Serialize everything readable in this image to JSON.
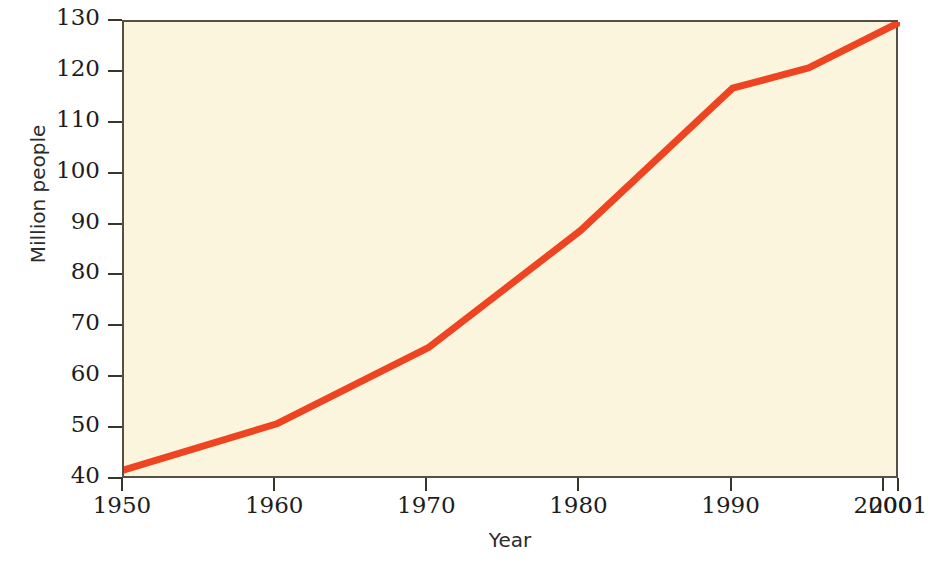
{
  "chart_data": {
    "type": "line",
    "title": "",
    "xlabel": "Year",
    "ylabel": "Million people",
    "xlim": [
      1950,
      2001
    ],
    "ylim": [
      40,
      130
    ],
    "grid": false,
    "legend": null,
    "series": [
      {
        "name": "Population",
        "color": "#ee4422",
        "x": [
          1950,
          1960,
          1970,
          1980,
          1990,
          1995,
          2001
        ],
        "values": [
          42,
          51,
          66,
          89,
          117,
          121,
          130
        ]
      }
    ],
    "x_ticks": [
      {
        "value": 1950,
        "label": "1950"
      },
      {
        "value": 1960,
        "label": "1960"
      },
      {
        "value": 1970,
        "label": "1970"
      },
      {
        "value": 1980,
        "label": "1980"
      },
      {
        "value": 1990,
        "label": "1990"
      },
      {
        "value": 2000,
        "label": "2000"
      },
      {
        "value": 2001,
        "label": "2001"
      }
    ],
    "y_ticks": [
      {
        "value": 130,
        "label": "130"
      },
      {
        "value": 120,
        "label": "120"
      },
      {
        "value": 110,
        "label": "110"
      },
      {
        "value": 100,
        "label": "100"
      },
      {
        "value": 90,
        "label": "90"
      },
      {
        "value": 80,
        "label": "80"
      },
      {
        "value": 70,
        "label": "70"
      },
      {
        "value": 60,
        "label": "60"
      },
      {
        "value": 50,
        "label": "50"
      },
      {
        "value": 40,
        "label": "40"
      }
    ]
  },
  "style": {
    "plot_background": "#faf5dc",
    "page_background": "#ffffff",
    "frame_color": "#564f45",
    "tick_color": "#3a342c",
    "text_color": "#1d1d1d",
    "line_color": "#ee4422",
    "line_width": 7
  }
}
